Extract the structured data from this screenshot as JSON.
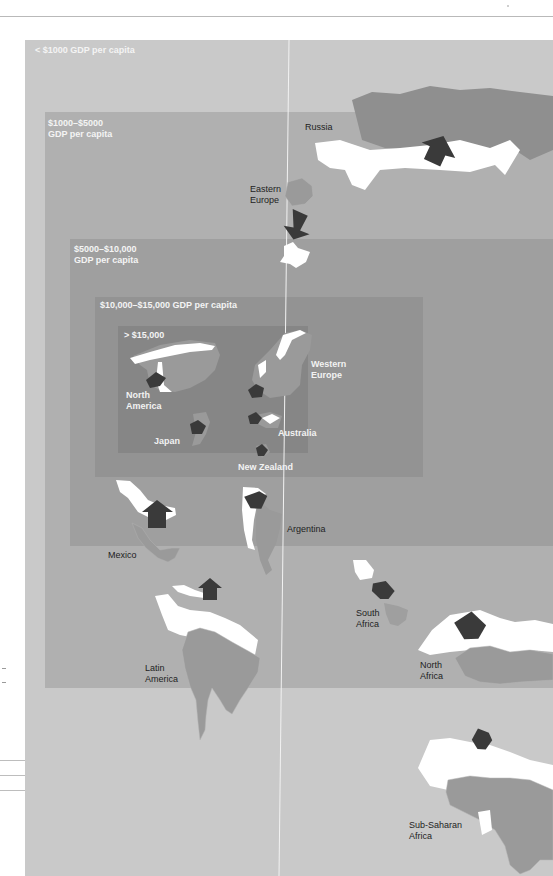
{
  "tiers": [
    {
      "id": "lt1000",
      "label": "< $1000 GDP per capita"
    },
    {
      "id": "1000-5000",
      "label_line1": "$1000–$5000",
      "label_line2": "GDP per capita"
    },
    {
      "id": "5000-10000",
      "label_line1": "$5000–$10,000",
      "label_line2": "GDP per capita"
    },
    {
      "id": "10000-15000",
      "label": "$10,000–$15,000 GDP per capita"
    },
    {
      "id": "gt15000",
      "label": "> $15,000"
    }
  ],
  "regions": {
    "russia": "Russia",
    "eastern_europe": [
      "Eastern",
      "Europe"
    ],
    "western_europe": [
      "Western",
      "Europe"
    ],
    "north_america": [
      "North",
      "America"
    ],
    "japan": "Japan",
    "australia": "Australia",
    "new_zealand": "New Zealand",
    "mexico": "Mexico",
    "argentina": "Argentina",
    "south_africa": [
      "South",
      "Africa"
    ],
    "latin_america": [
      "Latin",
      "America"
    ],
    "north_africa": [
      "North",
      "Africa"
    ],
    "sub_saharan_africa": [
      "Sub-Saharan",
      "Africa"
    ]
  },
  "colors": {
    "tier0": "#c9c9c9",
    "tier1": "#b0b0b0",
    "tier2": "#9f9f9f",
    "tier3": "#939393",
    "tier4": "#868686",
    "arrow": "#3a3a3a",
    "land_current": "#8f8f8f",
    "land_future": "#ffffff"
  }
}
